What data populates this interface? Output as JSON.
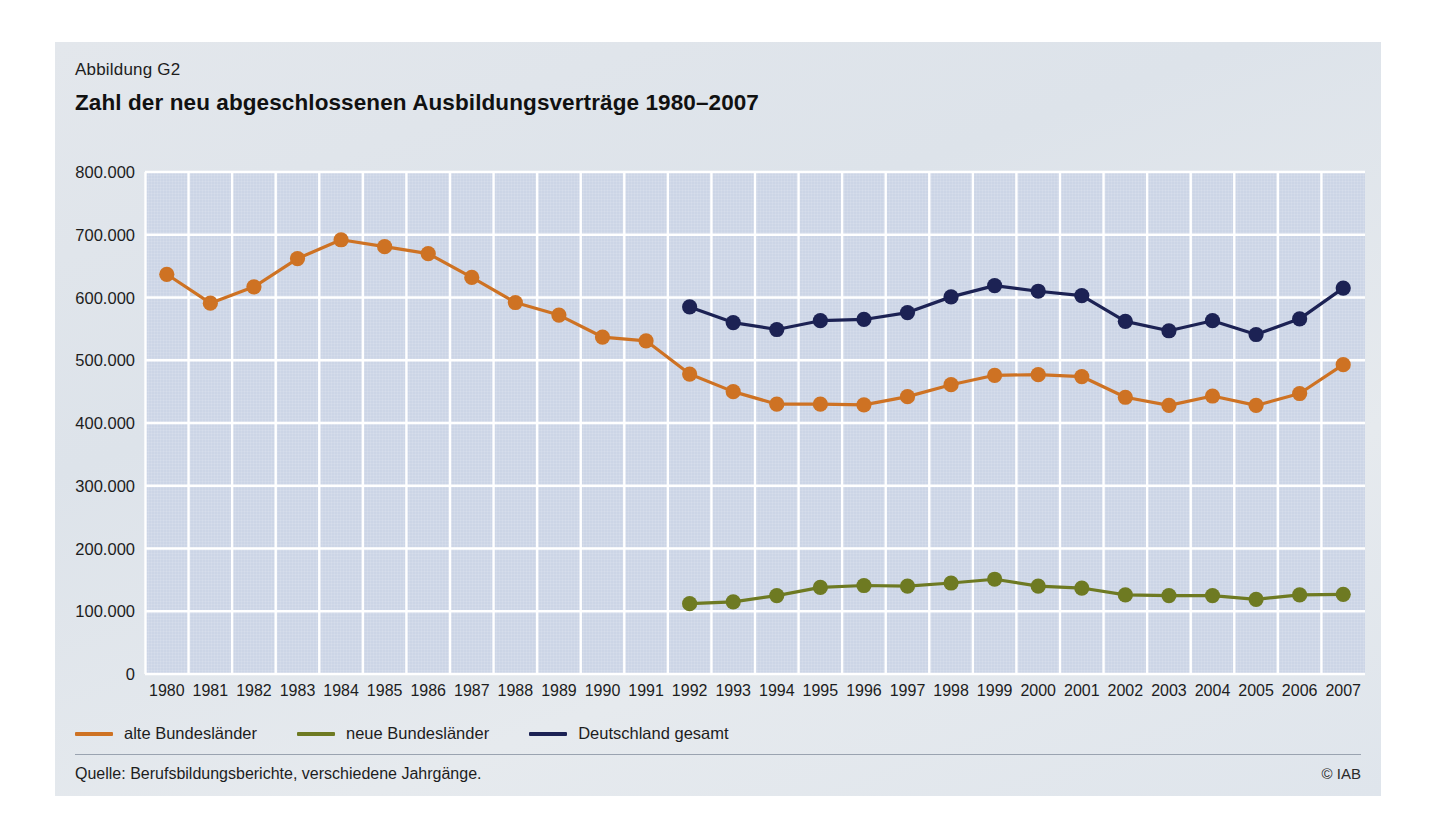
{
  "figure": {
    "label": "Abbildung G2",
    "title": "Zahl der neu abgeschlossenen Ausbildungsverträge 1980–2007",
    "source_note": "Quelle: Berufsbildungsberichte, verschiedene Jahrgänge.",
    "copyright": "© IAB"
  },
  "colors": {
    "alte_bundeslaender": "#CE7223",
    "neue_bundeslaender": "#6E7A22",
    "deutschland_gesamt": "#1C2254",
    "plot_background": "#CCD5E6",
    "card_background": "#E1E6EC",
    "gridline": "#FFFFFF"
  },
  "chart_data": {
    "type": "line",
    "title": "Zahl der neu abgeschlossenen Ausbildungsverträge 1980–2007",
    "xlabel": "",
    "ylabel": "",
    "grid": true,
    "legend_position": "bottom-left",
    "ylim": [
      0,
      800000
    ],
    "yticks": [
      0,
      100000,
      200000,
      300000,
      400000,
      500000,
      600000,
      700000,
      800000
    ],
    "ytick_labels": [
      "0",
      "100.000",
      "200.000",
      "300.000",
      "400.000",
      "500.000",
      "600.000",
      "700.000",
      "800.000"
    ],
    "categories": [
      "1980",
      "1981",
      "1982",
      "1983",
      "1984",
      "1985",
      "1986",
      "1987",
      "1988",
      "1989",
      "1990",
      "1991",
      "1992",
      "1993",
      "1994",
      "1995",
      "1996",
      "1997",
      "1998",
      "1999",
      "2000",
      "2001",
      "2002",
      "2003",
      "2004",
      "2005",
      "2006",
      "2007"
    ],
    "series": [
      {
        "name": "alte Bundesländer",
        "color": "#CE7223",
        "values": [
          637000,
          591000,
          617000,
          662000,
          692000,
          681000,
          670000,
          632000,
          592000,
          572000,
          537000,
          531000,
          478000,
          450000,
          430000,
          430000,
          429000,
          442000,
          461000,
          476000,
          477000,
          474000,
          441000,
          428000,
          443000,
          428000,
          447000,
          493000
        ]
      },
      {
        "name": "neue Bundesländer",
        "color": "#6E7A22",
        "values": [
          null,
          null,
          null,
          null,
          null,
          null,
          null,
          null,
          null,
          null,
          null,
          null,
          112000,
          115000,
          125000,
          138000,
          141000,
          140000,
          145000,
          151000,
          140000,
          137000,
          126000,
          125000,
          125000,
          119000,
          126000,
          127000
        ]
      },
      {
        "name": "Deutschland gesamt",
        "color": "#1C2254",
        "values": [
          null,
          null,
          null,
          null,
          null,
          null,
          null,
          null,
          null,
          null,
          null,
          null,
          585000,
          560000,
          549000,
          563000,
          565000,
          576000,
          601000,
          619000,
          610000,
          603000,
          562000,
          547000,
          563000,
          541000,
          566000,
          615000
        ]
      }
    ]
  },
  "legend": [
    {
      "label": "alte Bundesländer",
      "color": "#CE7223"
    },
    {
      "label": "neue Bundesländer",
      "color": "#6E7A22"
    },
    {
      "label": "Deutschland gesamt",
      "color": "#1C2254"
    }
  ]
}
